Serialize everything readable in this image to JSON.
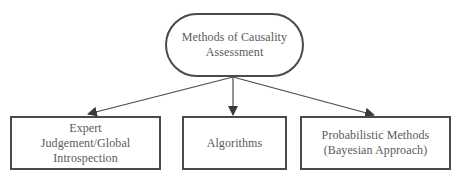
{
  "diagram": {
    "type": "tree",
    "root": {
      "id": "root",
      "shape": "rounded-pill",
      "label": "Methods of Causality\nAssessment"
    },
    "children": [
      {
        "id": "expert",
        "shape": "rectangle",
        "label": "Expert\nJudgement/Global\nIntrospection"
      },
      {
        "id": "algorithms",
        "shape": "rectangle",
        "label": "Algorithms"
      },
      {
        "id": "probabilistic",
        "shape": "rectangle",
        "label": "Probabilistic Methods\n(Bayesian Approach)"
      }
    ],
    "edges": [
      {
        "from": "root",
        "to": "expert",
        "style": "arrow"
      },
      {
        "from": "root",
        "to": "algorithms",
        "style": "arrow"
      },
      {
        "from": "root",
        "to": "probabilistic",
        "style": "arrow"
      }
    ],
    "colors": {
      "stroke": "#4a4a4a",
      "text": "#5a5a5a",
      "background": "#ffffff"
    }
  }
}
